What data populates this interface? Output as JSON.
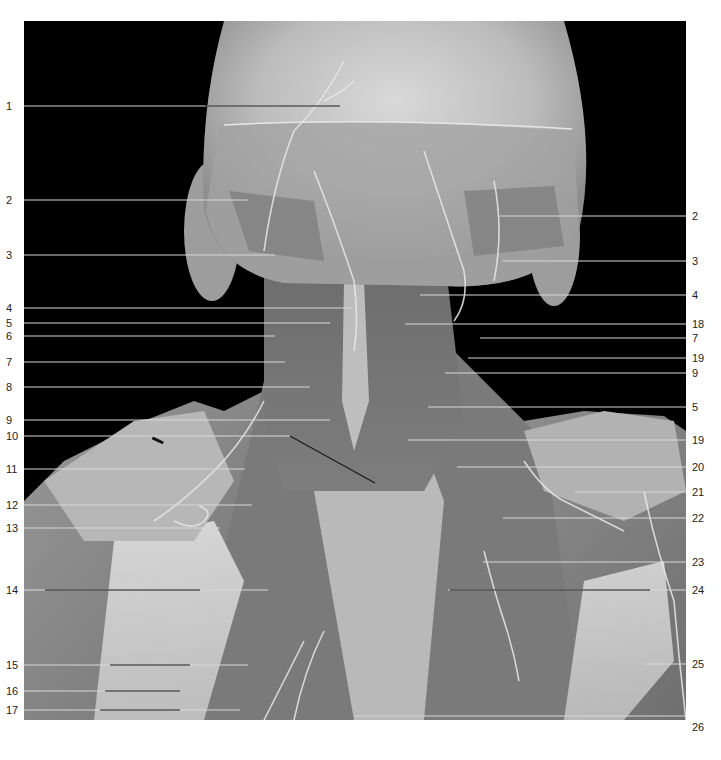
{
  "figure": {
    "view": "posterior dissection of head, neck and shoulders",
    "style": "grayscale photograph with numbered leader lines",
    "background_color": "#000000",
    "page_color": "#ffffff",
    "line_color_light": "#d8d8d8",
    "line_color_dark": "#1a1a1a"
  },
  "labels_left": [
    {
      "num": "1",
      "y": 106,
      "x_end": 340,
      "dark_from": 205
    },
    {
      "num": "2",
      "y": 200,
      "x_end": 248
    },
    {
      "num": "3",
      "y": 255,
      "x_end": 275
    },
    {
      "num": "4",
      "y": 308,
      "x_end": 352
    },
    {
      "num": "5",
      "y": 323,
      "x_end": 330
    },
    {
      "num": "6",
      "y": 336,
      "x_end": 275
    },
    {
      "num": "7",
      "y": 362,
      "x_end": 285
    },
    {
      "num": "8",
      "y": 387,
      "x_end": 310
    },
    {
      "num": "9",
      "y": 420,
      "x_end": 330
    },
    {
      "num": "10",
      "y": 436,
      "x_end": 290,
      "diag_to": [
        375,
        483
      ]
    },
    {
      "num": "11",
      "y": 469,
      "x_end": 245
    },
    {
      "num": "12",
      "y": 505,
      "x_end": 252
    },
    {
      "num": "13",
      "y": 528,
      "x_end": 220
    },
    {
      "num": "14",
      "y": 590,
      "x_end": 268,
      "dark_from": 45,
      "dark_to": 200
    },
    {
      "num": "15",
      "y": 665,
      "x_end": 248,
      "dark_from": 110,
      "dark_to": 190
    },
    {
      "num": "16",
      "y": 691,
      "x_end": 180,
      "dark_from": 105,
      "dark_to": 180
    },
    {
      "num": "17",
      "y": 710,
      "x_end": 240,
      "dark_from": 100,
      "dark_to": 180
    }
  ],
  "labels_right": [
    {
      "num": "2",
      "y": 216,
      "x_start": 500
    },
    {
      "num": "3",
      "y": 261,
      "x_start": 502
    },
    {
      "num": "4",
      "y": 295,
      "x_start": 420
    },
    {
      "num": "18",
      "y": 324,
      "x_start": 405
    },
    {
      "num": "7",
      "y": 338,
      "x_start": 480
    },
    {
      "num": "19",
      "y": 358,
      "x_start": 468
    },
    {
      "num": "9",
      "y": 373,
      "x_start": 445
    },
    {
      "num": "5",
      "y": 407,
      "x_start": 428
    },
    {
      "num": "19",
      "y": 440,
      "x_start": 408
    },
    {
      "num": "20",
      "y": 467,
      "x_start": 457
    },
    {
      "num": "21",
      "y": 492,
      "x_start": 575
    },
    {
      "num": "22",
      "y": 518,
      "x_start": 503
    },
    {
      "num": "23",
      "y": 562,
      "x_start": 483
    },
    {
      "num": "24",
      "y": 590,
      "x_start": 448,
      "dark_from": 450,
      "dark_to": 650
    },
    {
      "num": "25",
      "y": 664,
      "x_start": 645
    },
    {
      "num": "26",
      "y": 727,
      "x_start": 355
    }
  ]
}
